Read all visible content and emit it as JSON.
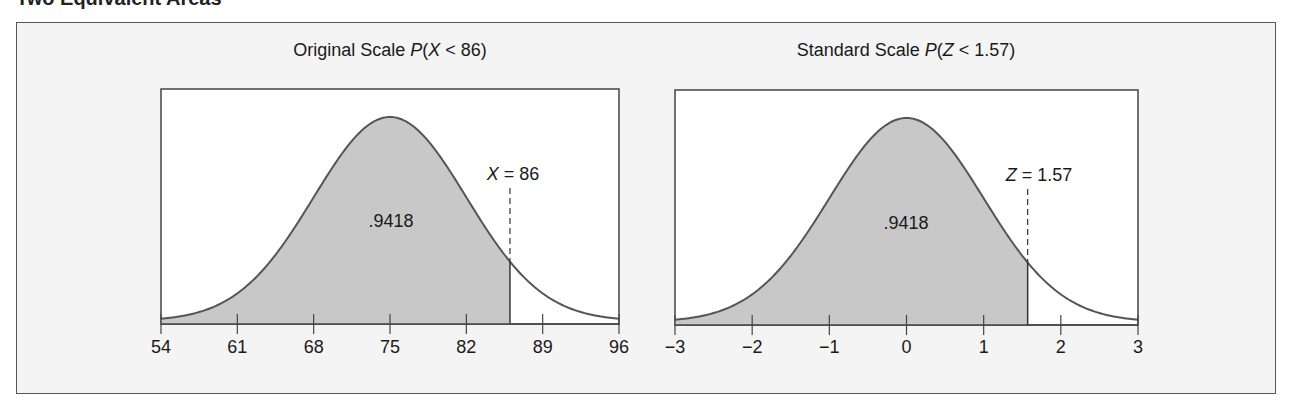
{
  "figure": {
    "heading_cut": "Two Equivalent Areas",
    "background_color": "#f4f4f4",
    "shade_color": "#c8c8c8",
    "curve_color": "#555555"
  },
  "chart_data": [
    {
      "type": "area",
      "title": "Original Scale P(X < 86)",
      "title_parts": {
        "prefix": "Original Scale ",
        "func": "P",
        "open": "(",
        "var": "X",
        "rest": " < 86)"
      },
      "distribution": "normal",
      "mean": 75,
      "sd": 7,
      "x_ticks": [
        54,
        61,
        68,
        75,
        82,
        89,
        96
      ],
      "xlim": [
        54,
        96
      ],
      "shaded_region": {
        "from": 54,
        "to": 86
      },
      "shaded_area_label": ".9418",
      "cutoff": {
        "value": 86,
        "var": "X",
        "label_rest": " = 86"
      },
      "grid": false,
      "legend": null
    },
    {
      "type": "area",
      "title": "Standard Scale P(Z < 1.57)",
      "title_parts": {
        "prefix": "Standard Scale ",
        "func": "P",
        "open": "(",
        "var": "Z",
        "rest": " < 1.57)"
      },
      "distribution": "normal",
      "mean": 0,
      "sd": 1,
      "x_ticks": [
        -3,
        -2,
        -1,
        0,
        1,
        2,
        3
      ],
      "x_tick_labels": [
        "−3",
        "−2",
        "−1",
        "0",
        "1",
        "2",
        "3"
      ],
      "xlim": [
        -3,
        3
      ],
      "shaded_region": {
        "from": -3,
        "to": 1.57
      },
      "shaded_area_label": ".9418",
      "cutoff": {
        "value": 1.57,
        "var": "Z",
        "label_rest": " = 1.57"
      },
      "grid": false,
      "legend": null
    }
  ]
}
